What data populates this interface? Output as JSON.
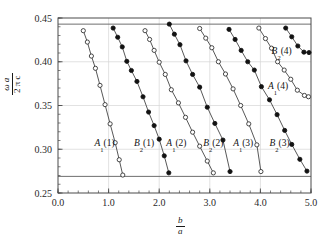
{
  "figure": {
    "background": "#ffffff",
    "frame_color": "#4a4a4a",
    "grid_color": "#d6d6d6",
    "band_line_color": "#6e6e6e",
    "marker_open_fill": "#ffffff",
    "marker_filled_fill": "#121212"
  },
  "axes": {
    "x": {
      "label_numerator": "b",
      "label_denominator": "a",
      "min": 0.0,
      "max": 5.0,
      "major_step": 1.0,
      "minor_step": 0.2,
      "ticks": [
        "0.0",
        "1.0",
        "2.0",
        "3.0",
        "4.0",
        "5.0"
      ],
      "tick_values": [
        0.0,
        1.0,
        2.0,
        3.0,
        4.0,
        5.0
      ]
    },
    "y": {
      "label_numerator": "ω a",
      "label_denominator": "2 π c",
      "min": 0.25,
      "max": 0.45,
      "major_step": 0.05,
      "minor_step": 0.01,
      "ticks": [
        "0.25",
        "0.30",
        "0.35",
        "0.40",
        "0.45"
      ],
      "tick_values": [
        0.25,
        0.3,
        0.35,
        0.4,
        0.45
      ]
    }
  },
  "chart_data": {
    "type": "line",
    "title": "",
    "subtitle": "",
    "xlabel": "b/a",
    "ylabel": "ωa/2πc",
    "xlim": [
      0.0,
      5.0
    ],
    "ylim": [
      0.25,
      0.45
    ],
    "grid": true,
    "legend": "none",
    "annotation_lines": [
      {
        "name": "upper-band-edge",
        "type": "horizontal",
        "y": 0.443
      },
      {
        "name": "lower-band-edge",
        "type": "horizontal",
        "y": 0.269
      }
    ],
    "series": [
      {
        "name": "A1(1)",
        "label_base": "A",
        "label_sub": "1",
        "label_paren": "(1)",
        "marker": "open-circle",
        "label_x": 0.92,
        "label_y": 0.3075,
        "x": [
          0.5,
          0.58,
          0.66,
          0.74,
          0.83,
          0.93,
          1.03,
          1.13,
          1.21,
          1.28
        ],
        "y": [
          0.4355,
          0.4225,
          0.4065,
          0.3925,
          0.373,
          0.351,
          0.329,
          0.3075,
          0.288,
          0.2705
        ]
      },
      {
        "name": "B2(1)",
        "label_base": "B",
        "label_sub": "2",
        "label_paren": "(1)",
        "marker": "filled-circle",
        "label_x": 1.7,
        "label_y": 0.3075,
        "x": [
          1.09,
          1.18,
          1.27,
          1.36,
          1.45,
          1.56,
          1.68,
          1.79,
          1.9,
          2.0,
          2.1,
          2.19
        ],
        "y": [
          0.4385,
          0.428,
          0.417,
          0.4005,
          0.39,
          0.3775,
          0.36,
          0.3425,
          0.327,
          0.3115,
          0.2925,
          0.273
        ]
      },
      {
        "name": "A1(2)",
        "label_base": "A",
        "label_sub": "1",
        "label_paren": "(2)",
        "marker": "open-circle",
        "label_x": 2.34,
        "label_y": 0.3075,
        "x": [
          1.72,
          1.81,
          1.9,
          2.0,
          2.12,
          2.24,
          2.38,
          2.52,
          2.66,
          2.8,
          2.95,
          3.07
        ],
        "y": [
          0.4355,
          0.4255,
          0.413,
          0.3995,
          0.3855,
          0.368,
          0.353,
          0.3365,
          0.3195,
          0.3035,
          0.2865,
          0.273
        ]
      },
      {
        "name": "B2(2)",
        "label_base": "B",
        "label_sub": "2",
        "label_paren": "(2)",
        "marker": "filled-circle",
        "label_x": 3.07,
        "label_y": 0.3075,
        "x": [
          2.2,
          2.3,
          2.41,
          2.53,
          2.66,
          2.8,
          2.95,
          3.1,
          3.26,
          3.4
        ],
        "y": [
          0.443,
          0.4315,
          0.4195,
          0.401,
          0.3855,
          0.371,
          0.348,
          0.3295,
          0.3105,
          0.2745
        ]
      },
      {
        "name": "A1(3)",
        "label_base": "A",
        "label_sub": "1",
        "label_paren": "(3)",
        "marker": "open-circle",
        "label_x": 3.66,
        "label_y": 0.3075,
        "x": [
          2.8,
          2.92,
          3.04,
          3.17,
          3.31,
          3.46,
          3.61,
          3.77,
          3.93,
          4.01
        ],
        "y": [
          0.438,
          0.427,
          0.416,
          0.4,
          0.386,
          0.369,
          0.35,
          0.329,
          0.305,
          0.2745
        ]
      },
      {
        "name": "B2(3)",
        "label_base": "B",
        "label_sub": "2",
        "label_paren": "(3)",
        "marker": "filled-circle",
        "label_x": 4.38,
        "label_y": 0.3075,
        "x": [
          3.38,
          3.5,
          3.62,
          3.75,
          3.88,
          4.02,
          4.18,
          4.33,
          4.48,
          4.62,
          4.78,
          4.92
        ],
        "y": [
          0.437,
          0.4255,
          0.413,
          0.4,
          0.3905,
          0.3715,
          0.3565,
          0.3395,
          0.3215,
          0.3055,
          0.2885,
          0.275
        ]
      },
      {
        "name": "A1(4)",
        "label_base": "A",
        "label_sub": "1",
        "label_paren": "(4)",
        "marker": "open-circle",
        "label_x": 4.35,
        "label_y": 0.372,
        "x": [
          3.97,
          4.1,
          4.22,
          4.34,
          4.47,
          4.6,
          4.73,
          4.87,
          4.95
        ],
        "y": [
          0.4385,
          0.4265,
          0.4155,
          0.4,
          0.3905,
          0.38,
          0.3675,
          0.3615,
          0.36
        ]
      },
      {
        "name": "B2(4)",
        "label_base": "B",
        "label_sub": "2",
        "label_paren": "(4)",
        "marker": "filled-circle",
        "label_x": 4.42,
        "label_y": 0.4125,
        "x": [
          4.5,
          4.62,
          4.74,
          4.86,
          4.96
        ],
        "y": [
          0.4385,
          0.4285,
          0.418,
          0.411,
          0.4105
        ]
      }
    ]
  }
}
